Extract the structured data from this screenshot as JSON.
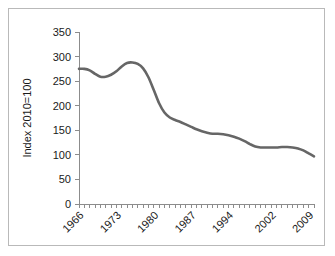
{
  "chart_data": {
    "type": "line",
    "title": "",
    "subtitle": "",
    "xlabel": "",
    "ylabel": "Index 2010=100",
    "ylim": [
      0,
      350
    ],
    "xlim": [
      1965,
      2009
    ],
    "ytick_values": [
      0,
      50,
      100,
      150,
      200,
      250,
      300,
      350
    ],
    "ytick_labels": [
      "0",
      "50",
      "100",
      "150",
      "200",
      "250",
      "300",
      "350"
    ],
    "xtick_labels": [
      "1966",
      "1973",
      "1980",
      "1987",
      "1994",
      "2002",
      "2009"
    ],
    "xtick_values": [
      1966,
      1973,
      1980,
      1987,
      1994,
      2002,
      2009
    ],
    "grid": false,
    "legend": false,
    "legend_position": "none",
    "line_color": "#666666",
    "minor_tick_interval": 1,
    "series": [
      {
        "name": "Index 2010=100",
        "x": [
          1965,
          1966,
          1967,
          1968,
          1969,
          1970,
          1971,
          1972,
          1973,
          1974,
          1975,
          1976,
          1977,
          1978,
          1979,
          1980,
          1981,
          1982,
          1983,
          1984,
          1985,
          1986,
          1987,
          1988,
          1989,
          1990,
          1991,
          1992,
          1993,
          1994,
          1995,
          1996,
          1997,
          1998,
          1999,
          2000,
          2001,
          2002,
          2003,
          2004,
          2005,
          2006,
          2007,
          2008,
          2009
        ],
        "values": [
          275,
          275,
          272,
          265,
          259,
          259,
          263,
          270,
          280,
          287,
          288,
          285,
          276,
          258,
          232,
          205,
          186,
          176,
          171,
          167,
          162,
          157,
          152,
          148,
          145,
          143,
          143,
          142,
          140,
          137,
          133,
          128,
          122,
          117,
          115,
          115,
          115,
          115,
          116,
          116,
          115,
          113,
          109,
          103,
          97
        ]
      }
    ]
  },
  "figure": {
    "border_color": "#b9b9b9",
    "background_color": "#ffffff"
  }
}
